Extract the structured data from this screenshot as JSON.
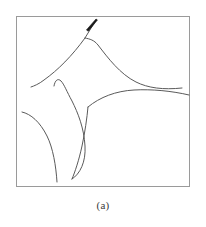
{
  "figure": {
    "caption": "(a)",
    "frame": {
      "x": 16,
      "y": 16,
      "width": 174,
      "height": 171,
      "color": "#9a9a9a",
      "stroke_width": 1
    },
    "curve_color": "#5a5a5a",
    "curve_stroke_width": 1,
    "background": "#ffffff"
  },
  "chart_data": {
    "type": "line",
    "title": "",
    "subtitle": "",
    "xlabel": "",
    "ylabel": "",
    "xlim": [
      16,
      190
    ],
    "ylim": [
      16,
      187
    ],
    "grid": false,
    "legend": null,
    "tick_labels": {
      "x": [],
      "y": []
    },
    "annotations": [
      {
        "name": "direction-arrow",
        "type": "arrowhead",
        "tip": [
          96,
          19
        ],
        "tail": [
          88,
          31
        ],
        "color": "#1a1a1a"
      },
      {
        "name": "caption-label",
        "type": "text",
        "text": "(a)",
        "position": [
          103,
          206
        ]
      }
    ],
    "series": [
      {
        "name": "arrow-stem-upper",
        "path": "M 96 20 L 85 38",
        "values": [
          [
            96,
            20
          ],
          [
            90,
            30
          ],
          [
            85,
            38
          ]
        ]
      },
      {
        "name": "upper-left-separatrix",
        "path": "M 85 38 C 72 56, 58 70, 44 80 C 39 84, 34 86, 31 87",
        "values": [
          [
            85,
            38
          ],
          [
            70,
            58
          ],
          [
            55,
            72
          ],
          [
            44,
            80
          ],
          [
            31,
            87
          ]
        ]
      },
      {
        "name": "upper-right-separatrix",
        "path": "M 85 38 C 90 39, 94 40, 98 45 C 108 58, 120 74, 136 82 C 148 88, 163 90, 182 88",
        "values": [
          [
            85,
            38
          ],
          [
            98,
            45
          ],
          [
            118,
            72
          ],
          [
            136,
            82
          ],
          [
            160,
            89
          ],
          [
            182,
            88
          ]
        ]
      },
      {
        "name": "lower-right-separatrix",
        "path": "M 88 107 C 100 97, 116 91, 134 90 C 152 89, 172 91, 189 95",
        "values": [
          [
            88,
            107
          ],
          [
            110,
            93
          ],
          [
            134,
            90
          ],
          [
            162,
            91
          ],
          [
            189,
            95
          ]
        ]
      },
      {
        "name": "hook-curve",
        "path": "M 54 86 C 55 80, 58 78, 61 81 C 64 84, 67 92, 72 101 C 78 113, 84 128, 85 146 C 86 162, 80 174, 72 179",
        "values": [
          [
            54,
            86
          ],
          [
            60,
            80
          ],
          [
            66,
            90
          ],
          [
            76,
            110
          ],
          [
            85,
            146
          ],
          [
            72,
            179
          ]
        ]
      },
      {
        "name": "lower-left-descender",
        "path": "M 22 112 C 31 114, 40 122, 47 136 C 53 148, 56 166, 57 182",
        "values": [
          [
            22,
            112
          ],
          [
            34,
            117
          ],
          [
            47,
            136
          ],
          [
            54,
            160
          ],
          [
            57,
            182
          ]
        ]
      },
      {
        "name": "center-descender",
        "path": "M 88 107 C 87 118, 85 132, 82 146 C 79 160, 75 172, 72 179",
        "values": [
          [
            88,
            107
          ],
          [
            85,
            130
          ],
          [
            80,
            154
          ],
          [
            72,
            179
          ]
        ]
      }
    ]
  }
}
